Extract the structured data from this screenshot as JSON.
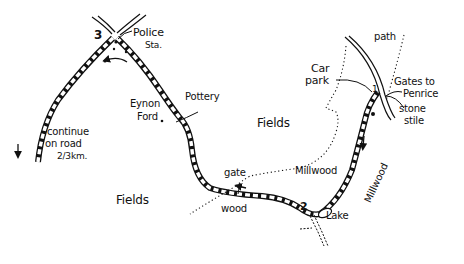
{
  "map": {
    "waypoints": {
      "wp1": "1",
      "wp2": "2",
      "wp3": "3"
    },
    "labels": {
      "police_station": "Police",
      "police_station_abbr": "Sta.",
      "eynon_ford_line1": "Eynon",
      "eynon_ford_line2": "Ford",
      "pottery": "Pottery",
      "continue_line1": "continue",
      "continue_line2": "on road",
      "continue_line3": "2/3km.",
      "fields_center": "Fields",
      "fields_left": "Fields",
      "gate": "gate",
      "wood": "wood",
      "millwood_path": "Millwood",
      "millwood_area": "Millwood",
      "lake": "Lake",
      "car_park_line1": "Car",
      "car_park_line2": "park",
      "path": "path",
      "gates_line1": "Gates to",
      "gates_line2": "Penrice",
      "stile_line1": "stone",
      "stile_line2": "stile"
    },
    "colors": {
      "ink": "#111111",
      "paper": "#ffffff"
    }
  }
}
